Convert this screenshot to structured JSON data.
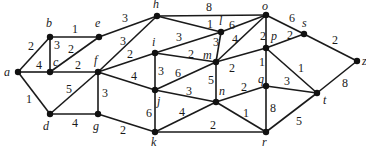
{
  "graph": {
    "type": "weighted-undirected",
    "nodes": [
      {
        "id": "a",
        "x": 18,
        "y": 72,
        "lx": 4,
        "ly": 76
      },
      {
        "id": "b",
        "x": 50,
        "y": 37,
        "lx": 46,
        "ly": 27
      },
      {
        "id": "c",
        "x": 50,
        "y": 72,
        "lx": 53,
        "ly": 66
      },
      {
        "id": "d",
        "x": 50,
        "y": 114,
        "lx": 43,
        "ly": 130
      },
      {
        "id": "e",
        "x": 99,
        "y": 37,
        "lx": 95,
        "ly": 27
      },
      {
        "id": "f",
        "x": 98,
        "y": 72,
        "lx": 94,
        "ly": 64
      },
      {
        "id": "g",
        "x": 98,
        "y": 114,
        "lx": 93,
        "ly": 130
      },
      {
        "id": "h",
        "x": 157,
        "y": 16,
        "lx": 153,
        "ly": 8
      },
      {
        "id": "i",
        "x": 155,
        "y": 53,
        "lx": 152,
        "ly": 46
      },
      {
        "id": "j",
        "x": 155,
        "y": 90,
        "lx": 157,
        "ly": 105
      },
      {
        "id": "k",
        "x": 155,
        "y": 132,
        "lx": 151,
        "ly": 146
      },
      {
        "id": "l",
        "x": 221,
        "y": 32,
        "lx": 219,
        "ly": 25
      },
      {
        "id": "m",
        "x": 216,
        "y": 62,
        "lx": 203,
        "ly": 59
      },
      {
        "id": "n",
        "x": 216,
        "y": 102,
        "lx": 219,
        "ly": 95
      },
      {
        "id": "o",
        "x": 266,
        "y": 15,
        "lx": 262,
        "ly": 10
      },
      {
        "id": "p",
        "x": 266,
        "y": 48,
        "lx": 271,
        "ly": 40
      },
      {
        "id": "q",
        "x": 266,
        "y": 86,
        "lx": 258,
        "ly": 83
      },
      {
        "id": "r",
        "x": 266,
        "y": 132,
        "lx": 262,
        "ly": 146
      },
      {
        "id": "s",
        "x": 304,
        "y": 34,
        "lx": 302,
        "ly": 27
      },
      {
        "id": "t",
        "x": 317,
        "y": 93,
        "lx": 323,
        "ly": 104
      },
      {
        "id": "z",
        "x": 357,
        "y": 61,
        "lx": 362,
        "ly": 65
      }
    ],
    "edges": [
      {
        "u": "a",
        "v": "b",
        "w": "2",
        "wx": 28,
        "wy": 50
      },
      {
        "u": "a",
        "v": "c",
        "w": "4",
        "wx": 36,
        "wy": 69
      },
      {
        "u": "a",
        "v": "d",
        "w": "1",
        "wx": 26,
        "wy": 103
      },
      {
        "u": "b",
        "v": "e",
        "w": "1",
        "wx": 72,
        "wy": 33
      },
      {
        "u": "b",
        "v": "c",
        "w": "3",
        "wx": 54,
        "wy": 49
      },
      {
        "u": "c",
        "v": "e",
        "w": "2",
        "wx": 68,
        "wy": 53
      },
      {
        "u": "c",
        "v": "f",
        "w": "2",
        "wx": 75,
        "wy": 69
      },
      {
        "u": "d",
        "v": "f",
        "w": "5",
        "wx": 66,
        "wy": 93
      },
      {
        "u": "d",
        "v": "g",
        "w": "4",
        "wx": 72,
        "wy": 127
      },
      {
        "u": "e",
        "v": "h",
        "w": "3",
        "wx": 122,
        "wy": 22
      },
      {
        "u": "f",
        "v": "h",
        "w": "3",
        "wx": 120,
        "wy": 45
      },
      {
        "u": "f",
        "v": "i",
        "w": "2",
        "wx": 127,
        "wy": 58
      },
      {
        "u": "f",
        "v": "j",
        "w": "4",
        "wx": 131,
        "wy": 80
      },
      {
        "u": "f",
        "v": "g",
        "w": "3",
        "wx": 102,
        "wy": 97
      },
      {
        "u": "g",
        "v": "k",
        "w": "2",
        "wx": 120,
        "wy": 134
      },
      {
        "u": "h",
        "v": "o",
        "w": "8",
        "wx": 206,
        "wy": 11
      },
      {
        "u": "h",
        "v": "l",
        "w": "1",
        "wx": 207,
        "wy": 28
      },
      {
        "u": "i",
        "v": "l",
        "w": "3",
        "wx": 176,
        "wy": 41
      },
      {
        "u": "i",
        "v": "m",
        "w": "2",
        "wx": 188,
        "wy": 58
      },
      {
        "u": "i",
        "v": "j",
        "w": "3",
        "wx": 158,
        "wy": 75
      },
      {
        "u": "j",
        "v": "m",
        "w": "6",
        "wx": 175,
        "wy": 77
      },
      {
        "u": "j",
        "v": "n",
        "w": "3",
        "wx": 186,
        "wy": 95
      },
      {
        "u": "j",
        "v": "k",
        "w": "6",
        "wx": 146,
        "wy": 117
      },
      {
        "u": "k",
        "v": "n",
        "w": "4",
        "wx": 179,
        "wy": 116
      },
      {
        "u": "k",
        "v": "r",
        "w": "2",
        "wx": 210,
        "wy": 129
      },
      {
        "u": "l",
        "v": "o",
        "w": "6",
        "wx": 229,
        "wy": 29
      },
      {
        "u": "l",
        "v": "m",
        "w": "3",
        "wx": 213,
        "wy": 46
      },
      {
        "u": "m",
        "v": "o",
        "w": "4",
        "wx": 232,
        "wy": 43
      },
      {
        "u": "m",
        "v": "p",
        "w": "2",
        "wx": 229,
        "wy": 72
      },
      {
        "u": "m",
        "v": "n",
        "w": "5",
        "wx": 208,
        "wy": 84
      },
      {
        "u": "n",
        "v": "q",
        "w": "2",
        "wx": 241,
        "wy": 91
      },
      {
        "u": "n",
        "v": "r",
        "w": "1",
        "wx": 243,
        "wy": 117
      },
      {
        "u": "o",
        "v": "p",
        "w": "2",
        "wx": 260,
        "wy": 40
      },
      {
        "u": "o",
        "v": "s",
        "w": "6",
        "wx": 289,
        "wy": 22
      },
      {
        "u": "p",
        "v": "s",
        "w": "2",
        "wx": 287,
        "wy": 39
      },
      {
        "u": "p",
        "v": "q",
        "w": "1",
        "wx": 259,
        "wy": 66
      },
      {
        "u": "p",
        "v": "t",
        "w": "1",
        "wx": 298,
        "wy": 72
      },
      {
        "u": "q",
        "v": "t",
        "w": "3",
        "wx": 284,
        "wy": 85
      },
      {
        "u": "q",
        "v": "r",
        "w": "8",
        "wx": 270,
        "wy": 112
      },
      {
        "u": "r",
        "v": "t",
        "w": "5",
        "wx": 296,
        "wy": 125
      },
      {
        "u": "s",
        "v": "z",
        "w": "2",
        "wx": 332,
        "wy": 44
      },
      {
        "u": "t",
        "v": "z",
        "w": "8",
        "wx": 342,
        "wy": 87
      }
    ]
  }
}
